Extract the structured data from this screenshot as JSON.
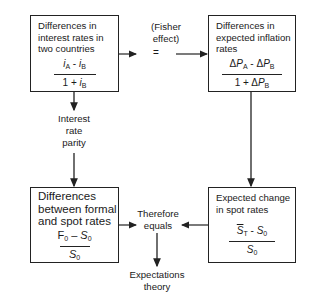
{
  "diagram": {
    "boxes": {
      "interest_rates": {
        "title_lines": [
          "Differences in",
          "interest rates in",
          "two countries"
        ],
        "formula": {
          "numerator": "iA - iB",
          "denominator": "1 + iB"
        }
      },
      "inflation_rates": {
        "title_lines": [
          "Differences in",
          "expected inflation",
          "rates"
        ],
        "formula": {
          "numerator": "ΔPA - ΔPB",
          "denominator": "1 + ΔPB"
        }
      },
      "forward_spot": {
        "title_lines": [
          "Differences",
          "between formal",
          "and spot rates"
        ],
        "formula": {
          "numerator": "F0 – S0",
          "denominator": "S0"
        }
      },
      "expected_change": {
        "title_lines": [
          "Expected change",
          "in spot rates"
        ],
        "formula": {
          "numerator": "S̄T - S0",
          "denominator": "S0"
        }
      }
    },
    "labels": {
      "fisher_effect": [
        "(Fisher",
        "effect)"
      ],
      "equals_sign": "=",
      "interest_rate_parity": [
        "Interest",
        "rate",
        "parity"
      ],
      "therefore_equals": [
        "Therefore",
        "equals"
      ],
      "expectations_theory": [
        "Expectations",
        "theory"
      ]
    },
    "colors": {
      "line": "#222222",
      "background": "#ffffff",
      "text": "#1a1a1a"
    }
  }
}
